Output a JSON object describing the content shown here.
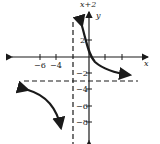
{
  "title_fragment": "x+2",
  "axes": {
    "x_label": "x",
    "y_label": "y",
    "x_ticks": [
      {
        "value": -6,
        "label": "−6"
      },
      {
        "value": -4,
        "label": "−4"
      },
      {
        "value": 2,
        "label": ""
      },
      {
        "value": 4,
        "label": ""
      },
      {
        "value": 6,
        "label": ""
      }
    ],
    "y_ticks": [
      {
        "value": 2,
        "label": "2"
      },
      {
        "value": -2,
        "label": "−2"
      },
      {
        "value": -4,
        "label": "−4"
      },
      {
        "value": -6,
        "label": "−6"
      },
      {
        "value": -8,
        "label": "−8"
      }
    ]
  },
  "asymptotes": {
    "vertical": "x = -2",
    "horizontal": "y = -3"
  },
  "colors": {
    "stroke": "#1a1a1a",
    "background": "#ffffff"
  }
}
